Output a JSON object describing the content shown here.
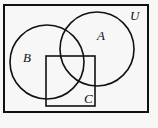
{
  "diagram": {
    "type": "venn",
    "universe": {
      "label": "U",
      "x": 4,
      "y": 5,
      "width": 144,
      "height": 107
    },
    "sets": [
      {
        "label": "A",
        "shape": "circle",
        "cx": 97,
        "cy": 49,
        "r": 37,
        "label_x": 97,
        "label_y": 40
      },
      {
        "label": "B",
        "shape": "circle",
        "cx": 47,
        "cy": 62,
        "r": 37,
        "label_x": 23,
        "label_y": 62
      },
      {
        "label": "C",
        "shape": "square",
        "x": 46,
        "y": 56,
        "width": 49,
        "height": 50,
        "label_x": 84,
        "label_y": 103
      }
    ],
    "universe_label_pos": {
      "x": 130,
      "y": 20
    },
    "stroke_color": "#111111",
    "background": "#f7f7f7"
  }
}
